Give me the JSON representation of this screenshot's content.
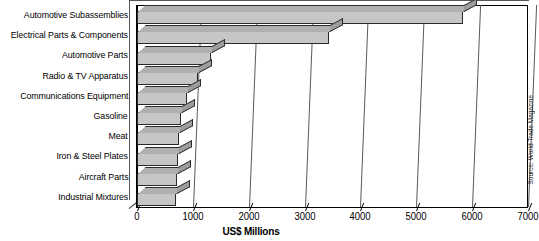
{
  "chart_data": {
    "type": "bar",
    "orientation": "horizontal",
    "style": "3d",
    "title": "",
    "xlabel": "US$ Millions",
    "ylabel": "",
    "xlim": [
      0,
      7000
    ],
    "xticks": [
      0,
      1000,
      2000,
      3000,
      4000,
      5000,
      6000,
      7000
    ],
    "xtick_labels": [
      "0",
      "1000",
      "2000",
      "3000",
      "4000",
      "5000",
      "6000",
      "7000"
    ],
    "grid": "vertical",
    "legend": "none",
    "categories": [
      "Automotive Subassemblies",
      "Electrical Parts & Components",
      "Automotive Parts",
      "Radio & TV Apparatus",
      "Communications Equipment",
      "Gasoline",
      "Meat",
      "Iron & Steel Plates",
      "Aircraft Parts",
      "Industrial Mixtures"
    ],
    "values": [
      5830,
      3440,
      1320,
      1100,
      890,
      790,
      760,
      740,
      720,
      700
    ],
    "annotations": [
      "Source: World Trade Magazine"
    ],
    "bar_fill_color": "#c6c6c6",
    "bar_top_color": "#b0b0b0",
    "bar_side_color": "#9d9d9d",
    "bar_edge_color": "#2b2b2b",
    "grid_color": "#5a5a5a",
    "axis_color": "#000000",
    "background_color": "#ffffff"
  },
  "source_note": "Source: World Trade Magazine"
}
